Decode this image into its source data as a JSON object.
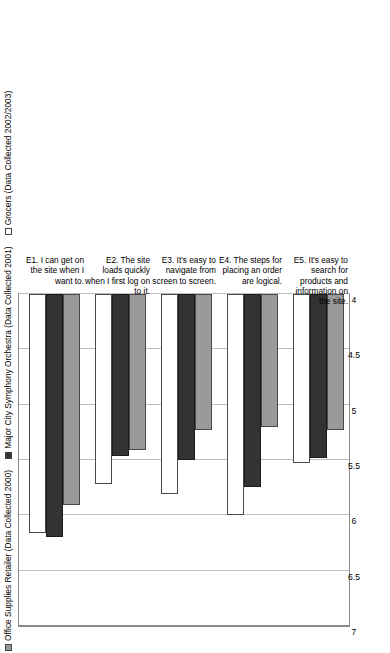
{
  "chart_data": {
    "type": "bar",
    "orientation": "horizontal",
    "title": "",
    "xlabel": "",
    "ylabel": "",
    "xlim": [
      4,
      7
    ],
    "xticks": [
      "7",
      "6.5",
      "6",
      "5.5",
      "5",
      "4.5",
      "4"
    ],
    "xtick_values": [
      7,
      6.5,
      6,
      5.5,
      5,
      4.5,
      4
    ],
    "grid": true,
    "legend_position": "top-left",
    "categories": [
      "E1.  I can get on the site when I want to.",
      "E2.  The site loads quickly when I first log on to it.",
      "E3.  It's easy to navigate from screen to screen.",
      "E4.  The steps for placing an order are logical.",
      "E5.  It's easy to search for products and information on the site."
    ],
    "series": [
      {
        "name": "Office Supplies Retailer (Data Collected 2000)",
        "color": "#9a9a9a",
        "values": [
          5.91,
          5.41,
          5.23,
          5.2,
          5.23
        ]
      },
      {
        "name": "Major City  Symphony Orchestra (Data Collected 2001)",
        "color": "#333333",
        "values": [
          6.2,
          5.46,
          5.5,
          5.74,
          5.48
        ]
      },
      {
        "name": "Grocers (Data Collected 2002/2003)",
        "color": "#ffffff",
        "values": [
          6.16,
          5.72,
          5.81,
          6.0,
          5.53
        ]
      }
    ]
  },
  "legend": {
    "items": [
      {
        "label": "Office Supplies Retailer (Data Collected 2000)",
        "swatch": "swatch-gray"
      },
      {
        "label": "Major City  Symphony Orchestra (Data Collected 2001)",
        "swatch": "swatch-black"
      },
      {
        "label": "Grocers (Data Collected 2002/2003)",
        "swatch": "swatch-white"
      }
    ]
  },
  "axis": {
    "ticks": [
      "7",
      "6.5",
      "6",
      "5.5",
      "5",
      "4.5",
      "4"
    ]
  },
  "categories_display": [
    {
      "code": "E1.",
      "text": "I can get on the site when I want to."
    },
    {
      "code": "E2.",
      "text": "The site loads quickly when I first log on to it."
    },
    {
      "code": "E3.",
      "text": "It's easy to navigate from screen to screen."
    },
    {
      "code": "E4.",
      "text": "The steps for placing an order are logical."
    },
    {
      "code": "E5.",
      "text": "It's easy to search for products and information on the site."
    }
  ]
}
